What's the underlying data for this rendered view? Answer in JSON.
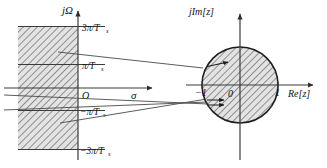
{
  "figure": {
    "type": "diagram",
    "background": "#ffffff",
    "stroke_color": "#3b3b3b",
    "hatch_color": "#6e6e6e",
    "fill_color": "#d9d9d9"
  },
  "s_plane": {
    "vertical_axis_label": "jΩ",
    "horizontal_axis_label": "σ",
    "origin_label": "O",
    "tick_labels": [
      "3π/T",
      "π/T",
      "−π/T",
      "−3π/T"
    ],
    "tick_subscripts": [
      "s",
      "s",
      "s",
      "s"
    ],
    "tick_values": [
      3,
      1,
      -1,
      -3
    ],
    "strip_fill": "hatched",
    "region": "left half plane strips, sigma < 0"
  },
  "z_plane": {
    "vertical_axis_label": "jIm[z]",
    "horizontal_axis_label": "Re[z]",
    "origin_label": "0",
    "real_tick_left": "−1",
    "real_tick_right": "1",
    "unit_circle_radius": 1,
    "disk_fill": "hatched",
    "region": "interior of unit circle"
  },
  "mapping_arrows": {
    "count": 3,
    "note": "strips map into unit disk"
  }
}
